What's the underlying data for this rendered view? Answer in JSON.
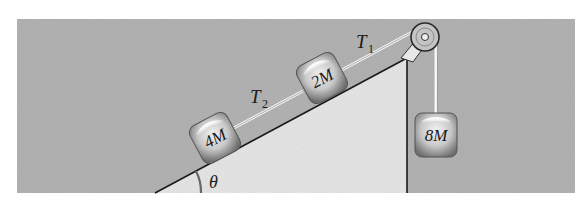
{
  "diagram": {
    "type": "physics-incline-pulley",
    "background_color": "#b3b3b3",
    "incline_color": "#e6e6e6",
    "angle_label": "θ",
    "blocks": [
      {
        "id": "block-4m",
        "label": "4M",
        "on": "incline"
      },
      {
        "id": "block-2m",
        "label": "2M",
        "on": "incline"
      },
      {
        "id": "block-8m",
        "label": "8M",
        "on": "hanging"
      }
    ],
    "tensions": [
      {
        "id": "t1",
        "symbol": "T",
        "subscript": "1",
        "between": "2M and pulley"
      },
      {
        "id": "t2",
        "symbol": "T",
        "subscript": "2",
        "between": "4M and 2M"
      }
    ],
    "pulley": {
      "position": "top of incline"
    }
  }
}
